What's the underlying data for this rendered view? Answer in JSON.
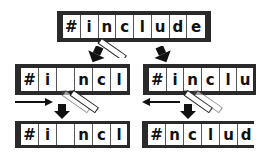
{
  "diagram": {
    "top": {
      "cells": [
        "#",
        "i",
        "n",
        "c",
        "l",
        "u",
        "d",
        "e"
      ]
    },
    "mid_left": {
      "cells": [
        "#",
        "i",
        "",
        "n",
        "c",
        "l"
      ]
    },
    "mid_right": {
      "cells": [
        "#",
        "i",
        "n",
        "c",
        "l",
        "u"
      ]
    },
    "bottom_left": {
      "cells": [
        "#",
        "i",
        "",
        "n",
        "c",
        "l"
      ]
    },
    "bottom_right": {
      "cells": [
        "#",
        "n",
        "c",
        "l",
        "u",
        "d"
      ]
    },
    "arrows": {
      "left_direction": "right",
      "right_direction": "left"
    }
  }
}
